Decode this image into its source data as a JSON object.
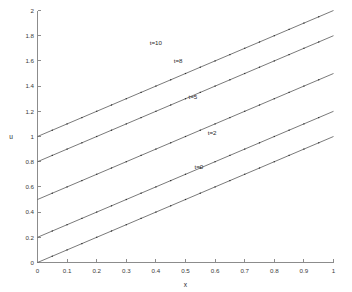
{
  "chart_data": {
    "type": "line",
    "title": "",
    "xlabel": "x",
    "ylabel": "u",
    "xlim": [
      0,
      1
    ],
    "ylim": [
      0,
      2
    ],
    "grid": false,
    "legend_position": "inline-annotations",
    "xticks": [
      "0",
      "0.1",
      "0.2",
      "0.3",
      "0.4",
      "0.5",
      "0.6",
      "0.7",
      "0.8",
      "0.9",
      "1"
    ],
    "xtick_values": [
      0,
      0.1,
      0.2,
      0.3,
      0.4,
      0.5,
      0.6,
      0.7,
      0.8,
      0.9,
      1
    ],
    "yticks": [
      "0",
      "0.2",
      "0.4",
      "0.6",
      "0.8",
      "1",
      "1.2",
      "1.4",
      "1.6",
      "1.8",
      "2"
    ],
    "ytick_values": [
      0,
      0.2,
      0.4,
      0.6,
      0.8,
      1,
      1.2,
      1.4,
      1.6,
      1.8,
      2
    ],
    "marker_style": "dot",
    "marker_x_step": 0.05,
    "x": [
      0,
      0.05,
      0.1,
      0.15,
      0.2,
      0.25,
      0.3,
      0.35,
      0.4,
      0.45,
      0.5,
      0.55,
      0.6,
      0.65,
      0.7,
      0.75,
      0.8,
      0.85,
      0.9,
      0.95,
      1
    ],
    "series": [
      {
        "name": "t=0",
        "intercept": 0,
        "slope": 1,
        "values": [
          0,
          0.05,
          0.1,
          0.15,
          0.2,
          0.25,
          0.3,
          0.35,
          0.4,
          0.45,
          0.5,
          0.55,
          0.6,
          0.65,
          0.7,
          0.75,
          0.8,
          0.85,
          0.9,
          0.95,
          1
        ],
        "label": "t=0",
        "label_x": 0.545,
        "label_y": 0.74
      },
      {
        "name": "t=2",
        "intercept": 0.2,
        "slope": 1,
        "values": [
          0.2,
          0.25,
          0.3,
          0.35,
          0.4,
          0.45,
          0.5,
          0.55,
          0.6,
          0.65,
          0.7,
          0.75,
          0.8,
          0.85,
          0.9,
          0.95,
          1.0,
          1.05,
          1.1,
          1.15,
          1.2
        ],
        "label": "t=2",
        "label_x": 0.59,
        "label_y": 1.01
      },
      {
        "name": "t=5",
        "intercept": 0.5,
        "slope": 1,
        "values": [
          0.5,
          0.55,
          0.6,
          0.65,
          0.7,
          0.75,
          0.8,
          0.85,
          0.9,
          0.95,
          1.0,
          1.05,
          1.1,
          1.15,
          1.2,
          1.25,
          1.3,
          1.35,
          1.4,
          1.45,
          1.5
        ],
        "label": "t=5",
        "label_x": 0.525,
        "label_y": 1.3
      },
      {
        "name": "t=8",
        "intercept": 0.8,
        "slope": 1,
        "values": [
          0.8,
          0.85,
          0.9,
          0.95,
          1.0,
          1.05,
          1.1,
          1.15,
          1.2,
          1.25,
          1.3,
          1.35,
          1.4,
          1.45,
          1.5,
          1.55,
          1.6,
          1.65,
          1.7,
          1.75,
          1.8
        ],
        "label": "t=8",
        "label_x": 0.475,
        "label_y": 1.58
      },
      {
        "name": "t=10",
        "intercept": 1.0,
        "slope": 1,
        "values": [
          1.0,
          1.05,
          1.1,
          1.15,
          1.2,
          1.25,
          1.3,
          1.35,
          1.4,
          1.45,
          1.5,
          1.55,
          1.6,
          1.65,
          1.7,
          1.75,
          1.8,
          1.85,
          1.9,
          1.95,
          2.0
        ],
        "label": "t=10",
        "label_x": 0.4,
        "label_y": 1.73
      }
    ],
    "colors": {
      "line": "#4d4d4d",
      "marker": "#2b2b2b",
      "axis": "#8c8c8c",
      "text": "#2a2a2a",
      "background": "#ffffff"
    }
  }
}
